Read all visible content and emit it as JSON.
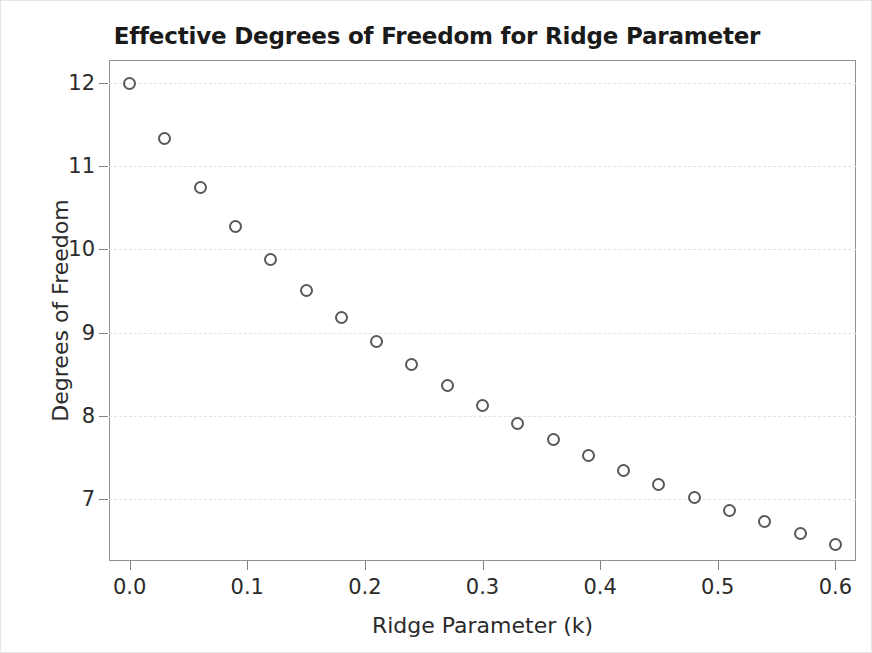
{
  "chart_data": {
    "type": "scatter",
    "title": "Effective Degrees of Freedom for Ridge Parameter",
    "xlabel": "Ridge Parameter (k)",
    "ylabel": "Degrees of Freedom",
    "xlim": [
      -0.0175,
      0.6175
    ],
    "ylim": [
      6.25,
      12.28
    ],
    "grid": true,
    "legend": null,
    "marker_style": "open-circle",
    "marker_color": "#585858",
    "xticks": [
      0.0,
      0.1,
      0.2,
      0.3,
      0.4,
      0.5,
      0.6
    ],
    "xtick_labels": [
      "0.0",
      "0.1",
      "0.2",
      "0.3",
      "0.4",
      "0.5",
      "0.6"
    ],
    "yticks": [
      7,
      8,
      9,
      10,
      11,
      12
    ],
    "ytick_labels": [
      "7",
      "8",
      "9",
      "10",
      "11",
      "12"
    ],
    "x": [
      0.0,
      0.03,
      0.06,
      0.09,
      0.12,
      0.15,
      0.18,
      0.21,
      0.24,
      0.27,
      0.3,
      0.33,
      0.36,
      0.39,
      0.42,
      0.45,
      0.48,
      0.51,
      0.54,
      0.57,
      0.6
    ],
    "values": [
      12.0,
      11.33,
      10.75,
      10.28,
      9.88,
      9.51,
      9.18,
      8.89,
      8.61,
      8.36,
      8.12,
      7.91,
      7.71,
      7.52,
      7.34,
      7.17,
      7.01,
      6.86,
      6.72,
      6.58,
      6.45
    ]
  },
  "figure": {
    "background": "#ffffff",
    "frame_color": "#909090",
    "grid_color": "#e3e3e3",
    "text_color": "#2b2b2b",
    "title_color": "#1a1a1a"
  }
}
